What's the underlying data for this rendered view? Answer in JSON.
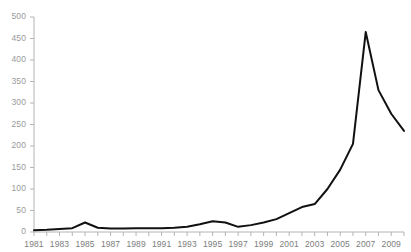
{
  "chart_data": {
    "type": "line",
    "title": "",
    "subtitle": "",
    "xlabel": "",
    "ylabel": "",
    "grid": false,
    "legend": false,
    "line_color": "#111111",
    "background_color": "#ffffff",
    "axis_color": "#b4b4b4",
    "tick_label_color": "#9a9a9a",
    "xlim": [
      1981,
      2010
    ],
    "ylim": [
      0,
      500
    ],
    "y_ticks": [
      0,
      50,
      100,
      150,
      200,
      250,
      300,
      350,
      400,
      450,
      500
    ],
    "y_tick_labels": [
      "0",
      "50",
      "100",
      "150",
      "200",
      "250",
      "300",
      "350",
      "400",
      "450",
      "500"
    ],
    "x_ticks": [
      1981,
      1982,
      1983,
      1984,
      1985,
      1986,
      1987,
      1988,
      1989,
      1990,
      1991,
      1992,
      1993,
      1994,
      1995,
      1996,
      1997,
      1998,
      1999,
      2000,
      2001,
      2002,
      2003,
      2004,
      2005,
      2006,
      2007,
      2008,
      2009,
      2010
    ],
    "x_tick_labels": [
      "1981",
      "1983",
      "1985",
      "1987",
      "1989",
      "1991",
      "1993",
      "1995",
      "1997",
      "1999",
      "2001",
      "2003",
      "2005",
      "2007",
      "2009"
    ],
    "x": [
      1981,
      1982,
      1983,
      1984,
      1985,
      1986,
      1987,
      1988,
      1989,
      1990,
      1991,
      1992,
      1993,
      1994,
      1995,
      1996,
      1997,
      1998,
      1999,
      2000,
      2001,
      2002,
      2003,
      2004,
      2005,
      2006,
      2007,
      2008,
      2009,
      2010
    ],
    "values": [
      4,
      5,
      7,
      9,
      22,
      10,
      8,
      8,
      9,
      9,
      9,
      10,
      12,
      18,
      25,
      22,
      12,
      16,
      22,
      30,
      44,
      58,
      65,
      100,
      145,
      205,
      465,
      330,
      275,
      235
    ],
    "series": [
      {
        "name": "",
        "values": [
          4,
          5,
          7,
          9,
          22,
          10,
          8,
          8,
          9,
          9,
          9,
          10,
          12,
          18,
          25,
          22,
          12,
          16,
          22,
          30,
          44,
          58,
          65,
          100,
          145,
          205,
          465,
          330,
          275,
          235
        ]
      }
    ]
  }
}
